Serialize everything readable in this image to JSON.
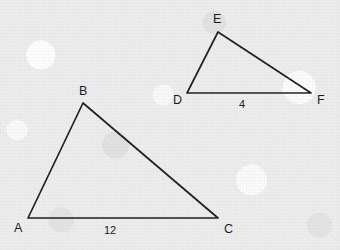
{
  "figure": {
    "background_color": "#ededed",
    "stroke_color": "#1b1b1b",
    "label_color": "#151515",
    "triangles": [
      {
        "name": "triangle-abc",
        "vertices": [
          {
            "label": "A",
            "x": 28,
            "y": 218,
            "label_x": 14,
            "label_y": 232
          },
          {
            "label": "B",
            "x": 83,
            "y": 103,
            "label_x": 79,
            "label_y": 95
          },
          {
            "label": "C",
            "x": 218,
            "y": 218,
            "label_x": 224,
            "label_y": 233
          }
        ],
        "side_labels": [
          {
            "text": "12",
            "x": 110,
            "y": 234,
            "side": "AC"
          }
        ]
      },
      {
        "name": "triangle-def",
        "vertices": [
          {
            "label": "D",
            "x": 187,
            "y": 93,
            "label_x": 173,
            "label_y": 104
          },
          {
            "label": "E",
            "x": 218,
            "y": 32,
            "label_x": 213,
            "label_y": 23
          },
          {
            "label": "F",
            "x": 311,
            "y": 93,
            "label_x": 317,
            "label_y": 104
          }
        ],
        "side_labels": [
          {
            "text": "4",
            "x": 242,
            "y": 108,
            "side": "DF"
          }
        ]
      }
    ]
  }
}
